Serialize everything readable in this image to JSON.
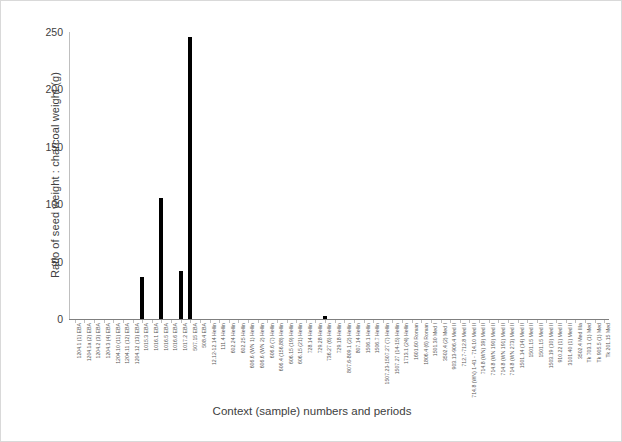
{
  "chart_data": {
    "type": "bar",
    "title": "",
    "xlabel": "Context (sample) numbers and periods",
    "ylabel": "Ratio of seed weight : charcoal weight (g)",
    "ylim": [
      0,
      250
    ],
    "yticks": [
      0,
      50,
      100,
      150,
      200,
      250
    ],
    "grid": false,
    "legend": "none",
    "bar_color": "#000000",
    "axis_color": "#bfbfbf",
    "categories": [
      "1204.1 (1) EBA",
      "1204.1a (2) EBA",
      "1204.2 (3) EBA",
      "1204.3 (4) EBA",
      "1204.10 (11) EBA",
      "1204.11 (12) EBA",
      "1204.12 (13) EBA",
      "1015.3 EBA",
      "1016.1 EBA",
      "1016.5 EBA",
      "1016.6 EBA",
      "1017.2 EBA",
      "507.15 EBA",
      "508.4 EBA",
      "12.12-12.14 Hellin",
      "111.4 Hellin",
      "602.24 Hellin",
      "602.25 Hellin",
      "606.6 (WN 1) Hellin",
      "606.6 (WN 2) Hellin",
      "606.6 (7) Hellin",
      "606.4 (156,88) Hellin",
      "606.15 (19) Hellin",
      "606.15 (21) Hellin",
      "728.14 Hellin",
      "729.28 Hellin",
      "736.27 (6) Hellin",
      "729.18 Hellin",
      "807.6-809.1 (2) Hellin",
      "807.14 Hellin",
      "1506.1 Hellin",
      "1506.7 Hellin",
      "1507.23-1507.27 (7) Hellin",
      "1507.27 (14-15) Hellin",
      "1713.1 (24) Hellin",
      "1601.60 Roman",
      "1806.4 (6) Roman",
      "1501.30 Med I",
      "3502.4 (2) Med I",
      "903.13-906.4 Med II",
      "712.7-712.8 Med II",
      "714.8 (WN) 1-41 - 714.10 Med II",
      "714.8 (WN) 39) Med II",
      "714.8 (WN 190) Med II",
      "714.8 (WN 191) Med II",
      "714.8 (WN 273) Med II",
      "1501.14 (14) Med II",
      "1501.15 Med II",
      "1501.15 Med II",
      "1503.19 (10) Med II",
      "910.22 (1) Med II",
      "3101.40 (1) Med II",
      "3502.4 Med IIIa",
      "Tk 703.1 (1) Med",
      "Tk 905.5 (1) Med",
      "Tk 201.15 Med"
    ],
    "values": [
      0,
      0,
      0,
      0,
      0,
      0,
      0,
      37,
      0,
      105,
      0,
      42,
      246,
      0,
      0,
      0,
      0,
      0,
      0,
      0,
      0,
      0,
      0,
      0,
      0,
      0,
      3,
      0,
      0,
      0,
      0,
      0,
      0,
      0,
      0,
      0,
      0,
      0,
      0,
      0,
      0,
      0,
      0,
      0,
      0,
      0,
      0,
      0,
      0,
      0,
      0,
      0,
      0,
      0,
      0,
      0
    ]
  }
}
